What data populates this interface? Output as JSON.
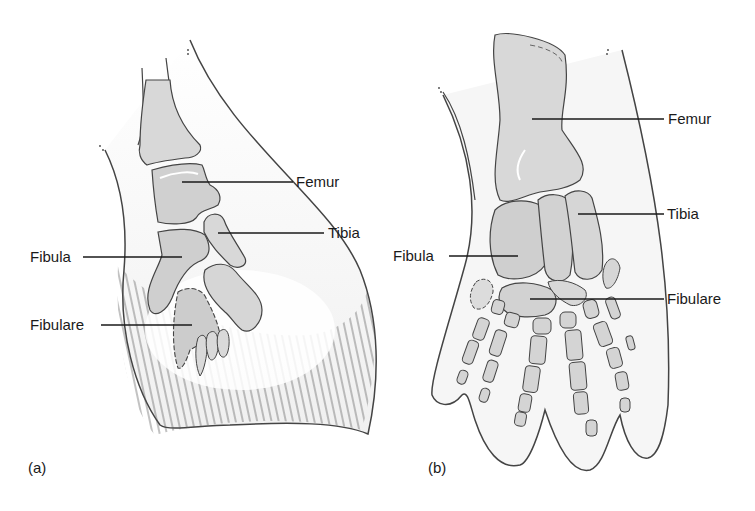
{
  "figure": {
    "panels": [
      {
        "id": "a",
        "panel_label": "(a)",
        "labels": {
          "femur": "Femur",
          "tibia": "Tibia",
          "fibula": "Fibula",
          "fibulare": "Fibulare"
        }
      },
      {
        "id": "b",
        "panel_label": "(b)",
        "labels": {
          "femur": "Femur",
          "tibia": "Tibia",
          "fibula": "Fibula",
          "fibulare": "Fibulare"
        }
      }
    ],
    "colors": {
      "bone_fill": "#d4d4d4",
      "bone_highlight": "#f2f2f2",
      "soft_tissue": "#f4f4f4",
      "outline": "#4a4a4a",
      "leader_line": "#1a1a1a"
    }
  }
}
